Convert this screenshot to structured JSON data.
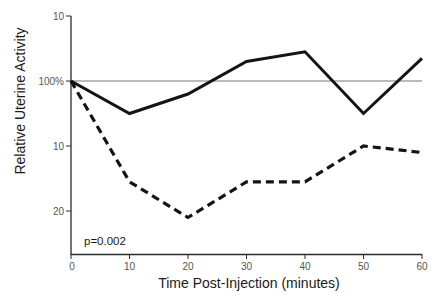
{
  "chart_data": {
    "type": "line",
    "title": "",
    "xlabel": "Time Post-Injection (minutes)",
    "ylabel": "Relative Uterine Activity",
    "x": [
      0,
      10,
      20,
      30,
      40,
      50,
      60
    ],
    "xlim": [
      0,
      60
    ],
    "x_ticks": [
      "0",
      "10",
      "20",
      "30",
      "40",
      "50",
      "60"
    ],
    "y_ticks": [
      {
        "label": "10",
        "value": 110
      },
      {
        "label": "100%",
        "value": 100
      },
      {
        "label": "10",
        "value": 90
      },
      {
        "label": "20",
        "value": 80
      }
    ],
    "ylim": [
      74,
      112
    ],
    "reference_line": {
      "value": 100,
      "label": "100%"
    },
    "series": [
      {
        "name": "solid",
        "style": "solid",
        "values": [
          100,
          95,
          98,
          103,
          104.5,
          95,
          103.5
        ]
      },
      {
        "name": "dashed",
        "style": "dashed",
        "values": [
          100,
          84.5,
          79,
          84.5,
          84.5,
          90,
          89
        ]
      }
    ],
    "annotations": [
      {
        "text": "p=0.002",
        "position": "bottom-left"
      }
    ],
    "grid": false,
    "legend": null,
    "colors": {
      "line": "#141414",
      "axis": "#2a2a2a",
      "reference": "#777777",
      "tick_text": "#555555"
    }
  },
  "labels": {
    "xlabel": "Time Post-Injection (minutes)",
    "ylabel": "Relative Uterine Activity",
    "pvalue": "p=0.002",
    "xticks": [
      "0",
      "10",
      "20",
      "30",
      "40",
      "50",
      "60"
    ],
    "yticks": [
      "10",
      "100%",
      "10",
      "20"
    ]
  }
}
